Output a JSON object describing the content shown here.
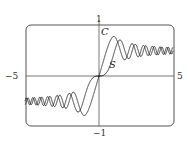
{
  "chart_data": {
    "type": "line",
    "title": "",
    "xlabel": "",
    "ylabel": "",
    "xlim": [
      -5,
      5
    ],
    "ylim": [
      -1,
      1
    ],
    "grid": false,
    "tick_labels": {
      "xmin": "−5",
      "xmax": "5",
      "ymax": "1",
      "ymin": "−1"
    },
    "series": [
      {
        "name": "C",
        "label": "C",
        "function": "C(x) = ∫₀ˣ cos(πt²/2) dt",
        "color": "#333333",
        "sample_points": [
          [
            -5,
            -0.564
          ],
          [
            -3,
            -0.606
          ],
          [
            -2,
            -0.488
          ],
          [
            -1.22,
            -0.78
          ],
          [
            -1,
            -0.78
          ],
          [
            0,
            0
          ],
          [
            1,
            0.78
          ],
          [
            1.22,
            0.78
          ],
          [
            2,
            0.488
          ],
          [
            3,
            0.606
          ],
          [
            5,
            0.564
          ]
        ]
      },
      {
        "name": "S",
        "label": "S",
        "function": "S(x) = ∫₀ˣ sin(πt²/2) dt",
        "color": "#333333",
        "sample_points": [
          [
            -5,
            -0.499
          ],
          [
            -3,
            -0.496
          ],
          [
            -2,
            -0.343
          ],
          [
            -1.41,
            -0.714
          ],
          [
            -1,
            -0.438
          ],
          [
            0,
            0
          ],
          [
            1,
            0.438
          ],
          [
            1.41,
            0.714
          ],
          [
            2,
            0.343
          ],
          [
            3,
            0.496
          ],
          [
            5,
            0.499
          ]
        ]
      }
    ],
    "curve_labels": [
      {
        "text": "C",
        "x": 0.35,
        "y": 0.85
      },
      {
        "text": "S",
        "x": 0.95,
        "y": 0.2
      }
    ]
  }
}
